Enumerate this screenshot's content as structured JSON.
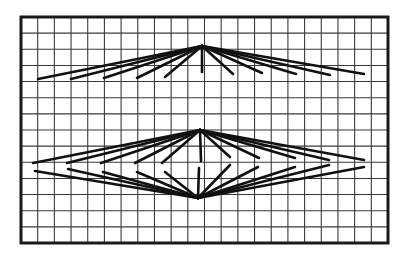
{
  "figure": {
    "width": 408,
    "height": 258,
    "background": "#ffffff",
    "line_color": "#111111",
    "grid_color": "#3a3a3a",
    "frame": {
      "x1": 21,
      "y1": 17,
      "x2": 388,
      "y2": 243
    },
    "grid": {
      "cols": 22,
      "rows": 14
    }
  },
  "upper_fan": {
    "apex": [
      202,
      46
    ],
    "rays": [
      [
        38,
        79
      ],
      [
        71,
        79
      ],
      [
        104,
        78
      ],
      [
        137,
        78
      ],
      [
        165,
        77
      ],
      [
        202,
        72
      ],
      [
        233,
        74
      ],
      [
        262,
        73
      ],
      [
        296,
        74
      ],
      [
        330,
        75
      ],
      [
        364,
        74
      ]
    ]
  },
  "lower_diamond": {
    "top_apex": [
      200,
      130
    ],
    "bottom_apex": [
      198,
      198
    ],
    "upper_rays": [
      [
        33,
        163
      ],
      [
        67,
        163
      ],
      [
        101,
        163
      ],
      [
        135,
        163
      ],
      [
        162,
        163
      ],
      [
        201,
        161
      ],
      [
        230,
        157
      ],
      [
        259,
        158
      ],
      [
        295,
        158
      ],
      [
        329,
        160
      ],
      [
        364,
        160
      ]
    ],
    "lower_rays": [
      [
        35,
        171
      ],
      [
        68,
        169
      ],
      [
        103,
        172
      ],
      [
        137,
        172
      ],
      [
        165,
        172
      ],
      [
        199,
        168
      ],
      [
        230,
        165
      ],
      [
        258,
        167
      ],
      [
        295,
        167
      ],
      [
        329,
        165
      ],
      [
        364,
        167
      ]
    ]
  }
}
